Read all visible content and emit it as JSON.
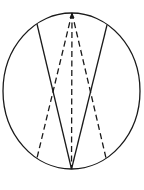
{
  "diagram": {
    "type": "geometry-figure",
    "canvas": {
      "width": 144,
      "height": 190,
      "background": "#ffffff"
    },
    "stroke_color": "#1a1a1a",
    "ellipse": {
      "cx": 71.5,
      "cy": 91,
      "rx": 68.5,
      "ry": 78
    },
    "top_vertex": {
      "x": 72,
      "y": 13
    },
    "bottom_vertex": {
      "x": 71.5,
      "y": 169
    },
    "solid_lines": [
      {
        "name": "left-solid-chord",
        "x1": 37,
        "y1": 24,
        "x2": 71.5,
        "y2": 169
      },
      {
        "name": "right-solid-chord",
        "x1": 107,
        "y1": 25,
        "x2": 71.5,
        "y2": 169
      }
    ],
    "dashed_lines": [
      {
        "name": "left-dashed-chord",
        "x1": 72,
        "y1": 13,
        "x2": 37,
        "y2": 158
      },
      {
        "name": "center-dashed-line",
        "x1": 72,
        "y1": 13,
        "x2": 71.5,
        "y2": 169
      },
      {
        "name": "right-dashed-chord",
        "x1": 72,
        "y1": 13,
        "x2": 106,
        "y2": 158
      }
    ],
    "intersections": [
      {
        "x": 53,
        "y": 90
      },
      {
        "x": 91,
        "y": 90
      }
    ]
  }
}
